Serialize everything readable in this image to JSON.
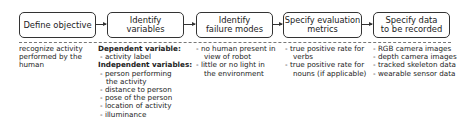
{
  "steps": [
    {
      "label": "Define objective"
    },
    {
      "label": "Identify\nvariables"
    },
    {
      "label": "Identify\nfailure modes"
    },
    {
      "label": "Specify evaluation\nmetrics"
    },
    {
      "label": "Specify data\nto be recorded"
    }
  ],
  "details": {
    "objective": [
      "recognize activity",
      "performed by the",
      "human"
    ],
    "variables": {
      "dependent_heading": "Dependent variable:",
      "dependent": [
        "- activity label"
      ],
      "independent_heading": "Independent variables:",
      "independent": [
        "- person performing",
        "the activity",
        "- distance to person",
        "- pose of the person",
        "- location of activity",
        "- illuminance"
      ]
    },
    "failure_modes": [
      "- no human present in",
      "view of robot",
      "- little or no light in",
      "the environment"
    ],
    "metrics": [
      "- true positive rate for",
      "verbs",
      "- true positive rate for",
      "nouns (if applicable)"
    ],
    "data": [
      "- RGB camera images",
      "- depth camera images",
      "- tracked skeleton data",
      "- wearable sensor data"
    ]
  }
}
